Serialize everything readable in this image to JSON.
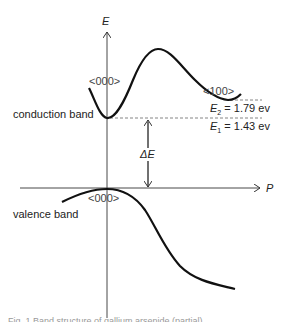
{
  "diagram": {
    "axes": {
      "y_label": "E",
      "x_label": "P"
    },
    "bands": {
      "conduction_label": "conduction band",
      "valence_label": "valence band"
    },
    "valleys": {
      "gamma_cb": "<000>",
      "x_valley": "<100>",
      "gamma_vb": "<000>"
    },
    "energies": {
      "e2_symbol": "E",
      "e2_sub": "2",
      "e2_value": "= 1.79 ev",
      "e1_symbol": "E",
      "e1_sub": "1",
      "e1_value": "= 1.43 ev",
      "gap_label": "ΔE"
    },
    "caption": "Fig. 1   Band structure of gallium arsenide (partial)"
  },
  "colors": {
    "curve": "#111111",
    "axis": "#333333",
    "dashed": "#666666",
    "text": "#222222"
  }
}
